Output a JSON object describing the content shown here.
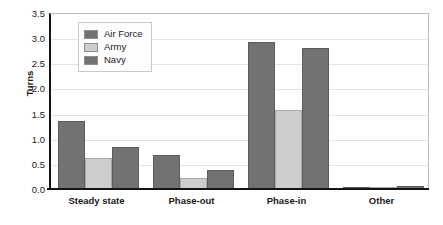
{
  "chart_data": {
    "type": "bar",
    "title": "",
    "xlabel": "",
    "ylabel": "Turns",
    "ylim": [
      0,
      3.5
    ],
    "ytick_labels": [
      "3.5",
      "3.0",
      "2.5",
      "2.0",
      "1.5",
      "1.0",
      "0.5",
      "0.0"
    ],
    "ytick_values": [
      3.5,
      3.0,
      2.5,
      2.0,
      1.5,
      1.0,
      0.5,
      0.0
    ],
    "grid": true,
    "legend_position": "upper-left-inside",
    "categories": [
      "Steady state",
      "Phase-out",
      "Phase-in",
      "Other"
    ],
    "series": [
      {
        "name": "Air Force",
        "color": "#727272",
        "values": [
          1.35,
          0.68,
          2.93,
          0.04
        ]
      },
      {
        "name": "Army",
        "color": "#cdcdcd",
        "values": [
          0.62,
          0.22,
          1.57,
          0.03
        ]
      },
      {
        "name": "Navy",
        "color": "#727272",
        "values": [
          0.84,
          0.38,
          2.8,
          0.06
        ]
      }
    ]
  },
  "legend": {
    "items": [
      {
        "label": "Air Force",
        "color": "#727272"
      },
      {
        "label": "Army",
        "color": "#cdcdcd"
      },
      {
        "label": "Navy",
        "color": "#727272"
      }
    ]
  },
  "colors": {
    "axis": "#141414",
    "grid": "#e3e3e3",
    "text": "#1a1a1a",
    "dark_bar": "#727272",
    "light_bar": "#cdcdcd",
    "background": "#ffffff"
  }
}
